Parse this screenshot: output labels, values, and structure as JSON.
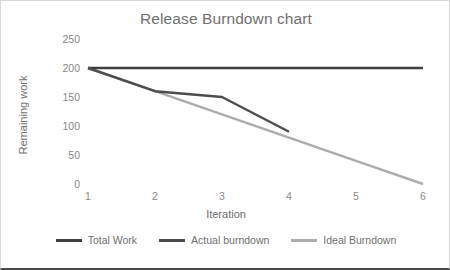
{
  "chart_data": {
    "type": "line",
    "title": "Release Burndown chart",
    "xlabel": "Iteration",
    "ylabel": "Remaining work",
    "x": [
      1,
      2,
      3,
      4,
      5,
      6
    ],
    "xtick_labels": [
      "1",
      "2",
      "3",
      "4",
      "5",
      "6"
    ],
    "xlim": [
      1,
      6
    ],
    "ytick_labels": [
      "250",
      "200",
      "150",
      "100",
      "50",
      "0"
    ],
    "ytick_values": [
      250,
      200,
      150,
      100,
      50,
      0
    ],
    "ylim": [
      0,
      250
    ],
    "grid": false,
    "legend_position": "bottom",
    "series": [
      {
        "name": "Total Work",
        "color": "#3f3f3f",
        "width": 2.6,
        "x": [
          1,
          2,
          3,
          4,
          5,
          6
        ],
        "values": [
          200,
          200,
          200,
          200,
          200,
          200
        ]
      },
      {
        "name": "Actual burndown",
        "color": "#4d4d4d",
        "width": 2.4,
        "x": [
          1,
          2,
          3,
          4
        ],
        "values": [
          200,
          160,
          150,
          90
        ]
      },
      {
        "name": "Ideal Burndown",
        "color": "#adadad",
        "width": 2.4,
        "x": [
          1,
          2,
          3,
          4,
          5,
          6
        ],
        "values": [
          200,
          160,
          120,
          80,
          40,
          0
        ]
      }
    ]
  }
}
